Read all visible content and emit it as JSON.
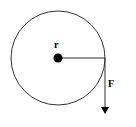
{
  "diagram": {
    "labels": {
      "radius": "r",
      "force": "F"
    },
    "colors": {
      "stroke": "#333333",
      "fill": "#000000",
      "background": "#ffffff"
    },
    "geometry": {
      "circle_center": [
        58,
        58
      ],
      "circle_radius": 47,
      "hub_radius": 4.5,
      "force_start": [
        105,
        58
      ],
      "force_end": [
        105,
        114
      ]
    }
  }
}
